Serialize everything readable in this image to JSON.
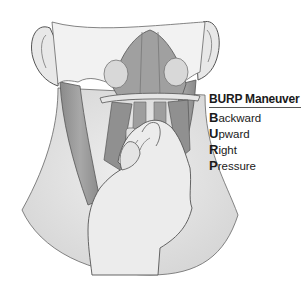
{
  "figure": {
    "colors": {
      "skin": "#e6e6e6",
      "muscle": "#9a9a9a",
      "muscle_dark": "#7d7d7d",
      "outline": "#555555",
      "background": "#ffffff"
    }
  },
  "legend": {
    "title": "BURP Maneuver",
    "items": [
      {
        "initial": "B",
        "rest": "ackward"
      },
      {
        "initial": "U",
        "rest": "pward"
      },
      {
        "initial": "R",
        "rest": "ight"
      },
      {
        "initial": "P",
        "rest": "ressure"
      }
    ]
  }
}
